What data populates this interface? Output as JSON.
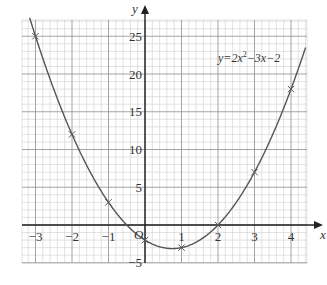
{
  "chart_data": {
    "type": "line",
    "title": "",
    "xlabel": "x",
    "ylabel": "y",
    "origin_label": "O",
    "equation_label": {
      "prefix": "y=2x",
      "sup": "2",
      "suffix": "−3x−2"
    },
    "function": {
      "a": 2,
      "b": -3,
      "c": -2
    },
    "xlim": [
      -3.4,
      4.4
    ],
    "ylim": [
      -5,
      27
    ],
    "x_ticks": [
      -3,
      -2,
      -1,
      1,
      2,
      3,
      4
    ],
    "x_tick_labels": [
      "−3",
      "−2",
      "−1",
      "1",
      "2",
      "3",
      "4"
    ],
    "y_ticks": [
      -5,
      5,
      10,
      15,
      20,
      25
    ],
    "y_tick_labels": [
      "−5",
      "5",
      "10",
      "15",
      "20",
      "25"
    ],
    "grid": true,
    "legend": "none",
    "points": [
      {
        "x": -3,
        "y": 25
      },
      {
        "x": -2,
        "y": 12
      },
      {
        "x": -1,
        "y": 3
      },
      {
        "x": 0,
        "y": -2
      },
      {
        "x": 1,
        "y": -3
      },
      {
        "x": 2,
        "y": 0
      },
      {
        "x": 3,
        "y": 7
      },
      {
        "x": 4,
        "y": 18
      }
    ],
    "colors": {
      "curve": "#555555",
      "axis": "#222222",
      "grid_major": "#9a9a9a",
      "grid_minor": "#cfcfcf"
    }
  }
}
